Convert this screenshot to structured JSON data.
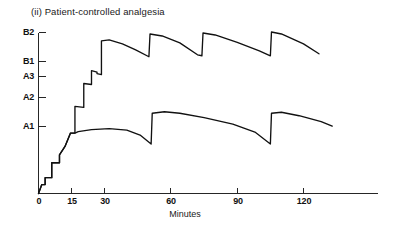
{
  "chart": {
    "title": "(ii) Patient-controlled analgesia",
    "xlabel": "Minutes"
  },
  "chart_data": {
    "type": "line",
    "title": "(ii) Patient-controlled analgesia",
    "xlabel": "Minutes",
    "ylabel": "",
    "grid": false,
    "legend": null,
    "xlim": [
      0,
      140
    ],
    "ylim": [
      0,
      3.35
    ],
    "xticks": [
      0,
      15,
      30,
      60,
      90,
      120
    ],
    "xtick_labels": [
      "0",
      "15",
      "30",
      "60",
      "90",
      "120"
    ],
    "yticks": [
      1.0,
      1.6,
      2.4,
      2.75,
      3.25
    ],
    "ytick_labels": [
      "A1",
      "A2",
      "A3",
      "B1",
      "B2"
    ],
    "ytick_values": {
      "A1": 1.0,
      "A2": 1.6,
      "A3": 2.4,
      "B1": 2.75,
      "B2": 3.25
    },
    "series": [
      {
        "name": "Lower dose regimen (A)",
        "description": "Loading staircase to A1 plateau, then PCA bolus sawtooth peaking near A2",
        "points": [
          [
            0,
            0.0
          ],
          [
            1.5,
            0.18
          ],
          [
            3.0,
            0.18
          ],
          [
            3.0,
            0.32
          ],
          [
            6.0,
            0.32
          ],
          [
            6.0,
            0.62
          ],
          [
            9.5,
            0.62
          ],
          [
            9.5,
            0.78
          ],
          [
            12.0,
            0.95
          ],
          [
            14.5,
            1.22
          ],
          [
            16.5,
            1.22
          ],
          [
            18.0,
            1.25
          ],
          [
            24.0,
            1.29
          ],
          [
            32.0,
            1.31
          ],
          [
            40.0,
            1.28
          ],
          [
            46.0,
            1.18
          ],
          [
            51.0,
            1.0
          ],
          [
            51.5,
            1.62
          ],
          [
            57.0,
            1.65
          ],
          [
            64.0,
            1.62
          ],
          [
            75.0,
            1.53
          ],
          [
            88.0,
            1.4
          ],
          [
            98.0,
            1.24
          ],
          [
            105.0,
            1.0
          ],
          [
            105.5,
            1.62
          ],
          [
            110.0,
            1.64
          ],
          [
            118.0,
            1.57
          ],
          [
            128.0,
            1.45
          ],
          [
            133.0,
            1.36
          ]
        ]
      },
      {
        "name": "Higher dose regimen (B)",
        "description": "Extended loading staircase to B2, then PCA bolus sawtooth between B1 and B2",
        "points": [
          [
            0,
            0.0
          ],
          [
            1.5,
            0.18
          ],
          [
            3.0,
            0.18
          ],
          [
            3.0,
            0.32
          ],
          [
            6.0,
            0.32
          ],
          [
            6.0,
            0.62
          ],
          [
            9.5,
            0.62
          ],
          [
            9.5,
            0.78
          ],
          [
            12.0,
            0.95
          ],
          [
            14.5,
            1.22
          ],
          [
            16.5,
            1.22
          ],
          [
            16.5,
            1.76
          ],
          [
            20.5,
            1.74
          ],
          [
            20.5,
            2.22
          ],
          [
            24.0,
            2.2
          ],
          [
            24.0,
            2.48
          ],
          [
            26.5,
            2.45
          ],
          [
            26.5,
            2.42
          ],
          [
            28.5,
            2.4
          ],
          [
            28.5,
            3.08
          ],
          [
            32.0,
            3.1
          ],
          [
            38.0,
            3.02
          ],
          [
            44.0,
            2.9
          ],
          [
            50.0,
            2.76
          ],
          [
            50.5,
            3.22
          ],
          [
            56.0,
            3.18
          ],
          [
            64.0,
            3.04
          ],
          [
            72.0,
            2.8
          ],
          [
            74.0,
            2.78
          ],
          [
            74.5,
            3.24
          ],
          [
            80.0,
            3.2
          ],
          [
            90.0,
            3.05
          ],
          [
            100.0,
            2.88
          ],
          [
            105.0,
            2.78
          ],
          [
            105.5,
            3.26
          ],
          [
            110.0,
            3.22
          ],
          [
            120.0,
            3.02
          ],
          [
            127.0,
            2.82
          ]
        ]
      }
    ]
  }
}
